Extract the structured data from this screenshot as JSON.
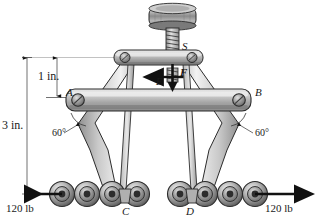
{
  "figure": {
    "type": "engineering-mechanics-diagram"
  },
  "labels": {
    "screw": "S",
    "pin_left": "A",
    "pin_right": "B",
    "roller_left": "C",
    "roller_right": "D",
    "point_e": "E",
    "force_f": "F"
  },
  "dimensions": {
    "upper": "1 in.",
    "overall": "3 in."
  },
  "angles": {
    "left": "60°",
    "right": "60°"
  },
  "forces": {
    "left_magnitude": "120 lb",
    "right_magnitude": "120 lb"
  },
  "colors": {
    "metal_light": "#d8d8d8",
    "metal_mid": "#a8a8a8",
    "metal_dark": "#6e6e6e",
    "outline": "#2b2b2b",
    "text": "#1a1a1a",
    "background": "#ffffff"
  }
}
